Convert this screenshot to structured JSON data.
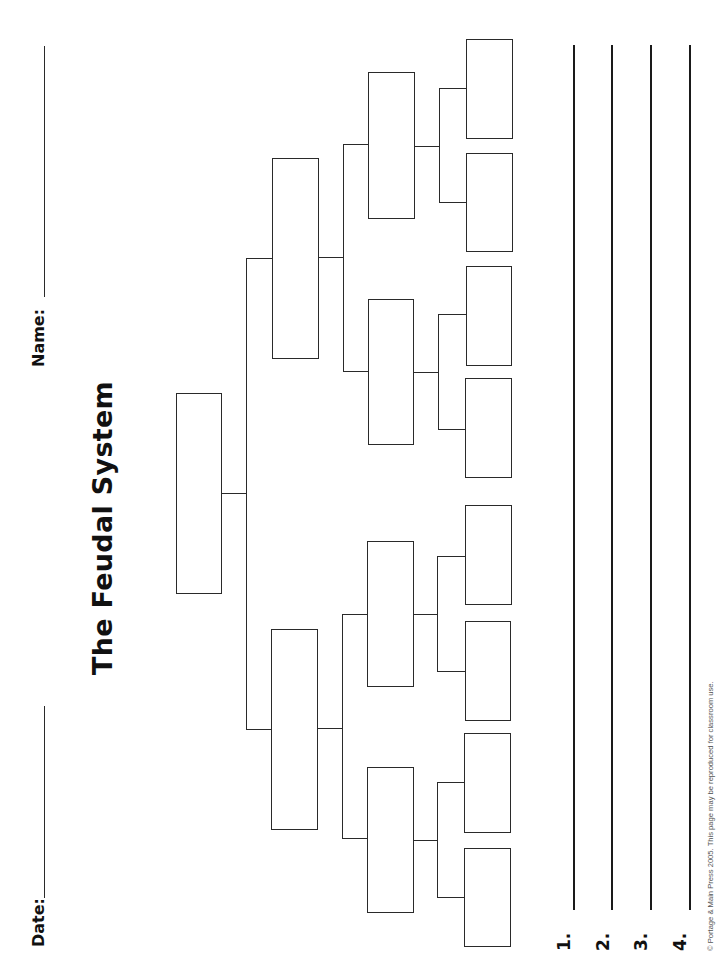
{
  "worksheet": {
    "title": "The Feudal System",
    "name_label": "Name:",
    "date_label": "Date:",
    "answer_numbers": [
      "1.",
      "2.",
      "3.",
      "4."
    ],
    "copyright": "© Portage & Main Press 2005. This page may be reproduced for classroom use.",
    "line_color": "#2a2a2a",
    "tree": {
      "levels": 4,
      "box_counts": [
        1,
        2,
        4,
        8
      ]
    }
  }
}
